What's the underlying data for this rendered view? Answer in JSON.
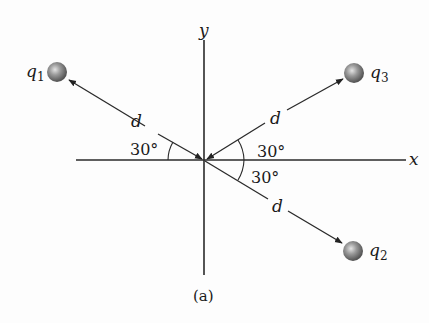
{
  "figure": {
    "caption": "(a)",
    "axes": {
      "x_label": "x",
      "y_label": "y"
    },
    "charges": [
      {
        "id": "q1",
        "label": "q",
        "subscript": "1",
        "direction": "upper-left",
        "angle_from_axis": "30°"
      },
      {
        "id": "q2",
        "label": "q",
        "subscript": "2",
        "direction": "lower-right",
        "angle_from_axis": "30°"
      },
      {
        "id": "q3",
        "label": "q",
        "subscript": "3",
        "direction": "upper-right",
        "angle_from_axis": "30°"
      }
    ],
    "distance_label": "d",
    "angles": {
      "left": "30°",
      "upper_right": "30°",
      "lower_right": "30°"
    },
    "colors": {
      "line": "#2a2a2a",
      "charge_fill": "#8a8a8a",
      "charge_highlight": "#d8d8d8"
    }
  }
}
